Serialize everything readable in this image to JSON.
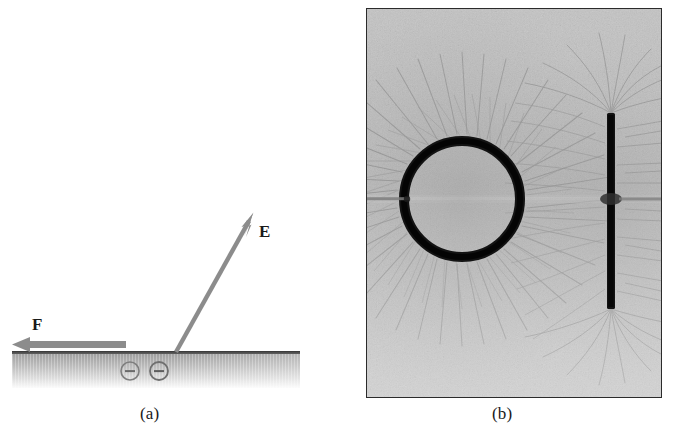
{
  "figure": {
    "type": "two-panel physics figure",
    "background_color": "#ffffff",
    "panels": [
      {
        "id": "a",
        "caption": "(a)",
        "kind": "schematic-diagram",
        "description": "Electric field and electrostatic force at a charged conductor surface",
        "elements": {
          "field_arrow_label": "E",
          "force_arrow_label": "F",
          "charge_symbols": [
            "−",
            "−"
          ],
          "charge_count": 2,
          "arrow_color": "#8c8c8c",
          "surface_top_line_color": "#4a4a4a",
          "slab_gradient_from": "#9b9b9b",
          "slab_gradient_to": "#f2f2f2"
        }
      },
      {
        "id": "b",
        "caption": "(b)",
        "kind": "photograph",
        "description": "Grass-seed visualization of electric field lines around a charged ring and a charged rod",
        "elements": {
          "ring_label": "charged ring",
          "rod_label": "charged rod",
          "frame_color": "#2b2b2b",
          "object_color": "#131313",
          "seed_field_base_color": "#b9b9b9"
        }
      }
    ]
  },
  "geometry": {
    "panel_a": {
      "slab": {
        "x": 12,
        "y": 352,
        "width": 288,
        "height": 36
      },
      "surface_line_y": 353,
      "e_arrow": {
        "x1": 176,
        "y1": 352,
        "x2": 252,
        "y2": 216,
        "label_x": 259,
        "label_y": 231
      },
      "f_arrow": {
        "x1": 126,
        "y1": 344,
        "x2": 13,
        "y2": 344,
        "label_x": 38,
        "label_y": 330
      },
      "charges": [
        {
          "cx": 130,
          "cy": 371,
          "r": 9
        },
        {
          "cx": 159,
          "cy": 371,
          "r": 9
        }
      ]
    },
    "panel_b": {
      "frame": {
        "x": 366,
        "y": 8,
        "width": 296,
        "height": 390
      },
      "ring": {
        "cx": 95,
        "cy": 190,
        "r": 58,
        "stroke_width": 10
      },
      "rod": {
        "x": 244,
        "y_top": 104,
        "y_bottom": 300,
        "width": 8
      }
    }
  }
}
